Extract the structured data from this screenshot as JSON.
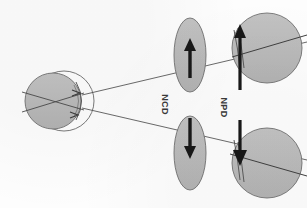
{
  "figure": {
    "background_color": "#fdfdfd",
    "ink_color": "#3a3a3a",
    "fill_gray": "#b9b9b9",
    "fill_gray_dark": "#ababab",
    "outline_color": "#555555"
  },
  "labels": {
    "ncd": "NCD",
    "npd": "NPD"
  },
  "source_eye": {
    "name": "source-eye",
    "globe_fill": "#b9b9b9",
    "cornea_outline": "#555555",
    "angle_marker_upper": "arrow-marker-upper",
    "angle_marker_lower": "arrow-marker-lower"
  },
  "ray_lines": {
    "upper_ray": "upper-projection-ray",
    "lower_ray": "lower-projection-ray",
    "color": "#4a4a4a"
  },
  "ellipses": [
    {
      "name": "ncd-ellipse-upper",
      "arrow_direction": "up",
      "fill": "#b9b9b9"
    },
    {
      "name": "ncd-ellipse-lower",
      "arrow_direction": "down",
      "fill": "#b9b9b9"
    }
  ],
  "target_eyes": [
    {
      "name": "target-eye-upper",
      "arrow_direction": "up",
      "fill": "#b9b9b9"
    },
    {
      "name": "target-eye-lower",
      "arrow_direction": "down",
      "fill": "#b9b9b9"
    }
  ]
}
